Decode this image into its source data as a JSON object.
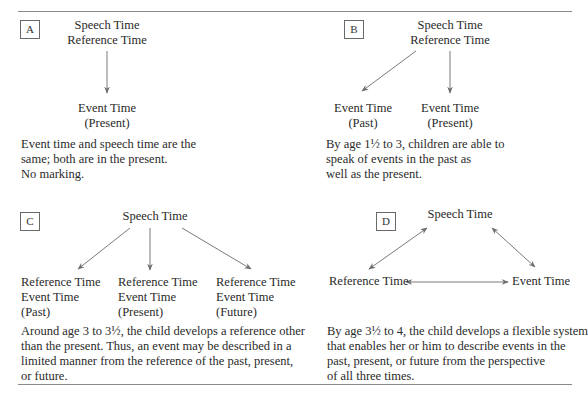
{
  "figure": {
    "colors": {
      "text": "#2a2a2a",
      "arrow": "#6e6e6e",
      "rule": "#8a8a8a",
      "box": "#6a6a6a"
    },
    "panels": {
      "A": {
        "tag": "A",
        "top": [
          "Speech Time",
          "Reference Time"
        ],
        "event": [
          "Event Time",
          "(Present)"
        ],
        "description": [
          "Event time and speech time are the",
          "same; both are in the present.",
          "No marking."
        ]
      },
      "B": {
        "tag": "B",
        "top": [
          "Speech Time",
          "Reference Time"
        ],
        "event_past": [
          "Event Time",
          "(Past)"
        ],
        "event_present": [
          "Event Time",
          "(Present)"
        ],
        "description": [
          "By age 1½ to 3, children are able to",
          "speak of events in the past as",
          "well as the present."
        ]
      },
      "C": {
        "tag": "C",
        "top": "Speech Time",
        "branches": [
          [
            "Reference Time",
            "Event Time",
            "(Past)"
          ],
          [
            "Reference Time",
            "Event Time",
            "(Present)"
          ],
          [
            "Reference Time",
            "Event Time",
            "(Future)"
          ]
        ],
        "description": [
          "Around age 3 to 3½, the child develops a reference other",
          "than the present. Thus, an event may be described in a",
          "limited manner from the reference of the past, present,",
          "or future."
        ]
      },
      "D": {
        "tag": "D",
        "top": "Speech Time",
        "left": "Reference Time",
        "right": "Event Time",
        "description": [
          "By age 3½ to 4, the child develops a flexible system",
          "that enables her or him to describe events in the",
          "past, present, or future from the perspective",
          "of all three times."
        ]
      }
    }
  }
}
